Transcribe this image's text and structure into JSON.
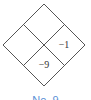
{
  "diagram": {
    "type": "diamond-grid",
    "rows": 2,
    "cols": 2,
    "cells": [
      {
        "position": "top",
        "value": ""
      },
      {
        "position": "left",
        "value": ""
      },
      {
        "position": "right",
        "value": "−1"
      },
      {
        "position": "bottom",
        "value": "−9"
      }
    ],
    "line_color": "#555555"
  },
  "caption": {
    "text": "No. 9",
    "color": "#5b8fd6"
  }
}
